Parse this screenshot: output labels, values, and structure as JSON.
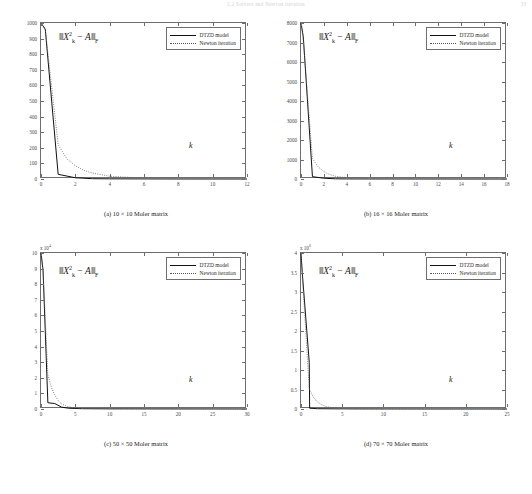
{
  "running_head": "2.2 Solvers and Newton iteration",
  "page_number": "33",
  "legend": {
    "dtzd_label": "DTZD model",
    "newton_label": "Newton iteration"
  },
  "norm_label": {
    "prefix": "‖",
    "x": "X",
    "sub_k": "k",
    "sup_2": "2",
    "minus": " − ",
    "a": "A",
    "suffix": "‖",
    "sub_f": "F",
    "plain": "‖X²ₖ − A‖F"
  },
  "k_axis_label": "k",
  "panels": [
    {
      "id": "a",
      "caption": "(a) 10 × 10 Moler matrix",
      "matrix_size": "10 × 10",
      "exponent_text": "",
      "y_ticks": [
        "0",
        "100",
        "200",
        "300",
        "400",
        "500",
        "600",
        "700",
        "800",
        "900",
        "1000"
      ],
      "x_ticks": [
        "0",
        "2",
        "4",
        "6",
        "8",
        "10",
        "12"
      ]
    },
    {
      "id": "b",
      "caption": "(b) 16 × 16 Moler matrix",
      "matrix_size": "16 × 16",
      "exponent_text": "",
      "y_ticks": [
        "0",
        "1000",
        "2000",
        "3000",
        "4000",
        "5000",
        "6000",
        "7000",
        "8000"
      ],
      "x_ticks": [
        "0",
        "2",
        "4",
        "6",
        "8",
        "10",
        "12",
        "14",
        "16",
        "18"
      ]
    },
    {
      "id": "c",
      "caption": "(c) 50 × 50 Moler matrix",
      "matrix_size": "50 × 50",
      "exponent_text": "x 10",
      "exponent_power": "4",
      "y_ticks": [
        "0",
        "1",
        "2",
        "3",
        "4",
        "5",
        "6",
        "7",
        "8",
        "9",
        "10"
      ],
      "x_ticks": [
        "0",
        "5",
        "10",
        "15",
        "20",
        "25",
        "30"
      ]
    },
    {
      "id": "d",
      "caption": "(d) 70 × 70 Moler matrix",
      "matrix_size": "70 × 70",
      "exponent_text": "x 10",
      "exponent_power": "6",
      "y_ticks": [
        "0",
        "0.5",
        "1",
        "1.5",
        "2",
        "2.5",
        "3",
        "3.5",
        "4"
      ],
      "x_ticks": [
        "0",
        "5",
        "10",
        "15",
        "20",
        "25"
      ]
    }
  ],
  "chart_data": [
    {
      "type": "line",
      "title": "(a) 10 × 10 Moler matrix",
      "xlabel": "k",
      "ylabel": "‖X_k^2 − A‖_F",
      "xlim": [
        0,
        12
      ],
      "ylim": [
        0,
        1000
      ],
      "y_scale_factor": 1,
      "grid": false,
      "legend_position": "top-right",
      "series": [
        {
          "name": "DTZD model",
          "style": "solid",
          "x": [
            0,
            0.25,
            1,
            2,
            3,
            4,
            6,
            8,
            10,
            12
          ],
          "y": [
            1000,
            960,
            30,
            8,
            2,
            1,
            0.5,
            0.2,
            0.1,
            0.05
          ]
        },
        {
          "name": "Newton iteration",
          "style": "dotted",
          "x": [
            0,
            0.25,
            1,
            1.5,
            2,
            2.5,
            3,
            4,
            6,
            8,
            10,
            12
          ],
          "y": [
            1000,
            955,
            220,
            130,
            85,
            55,
            38,
            18,
            5,
            2,
            1,
            0.5
          ]
        }
      ]
    },
    {
      "type": "line",
      "title": "(b) 16 × 16 Moler matrix",
      "xlabel": "k",
      "ylabel": "‖X_k^2 − A‖_F",
      "xlim": [
        0,
        18
      ],
      "ylim": [
        0,
        8000
      ],
      "y_scale_factor": 1,
      "grid": false,
      "legend_position": "top-right",
      "series": [
        {
          "name": "DTZD model",
          "style": "solid",
          "x": [
            0,
            0.2,
            1,
            2,
            3,
            4,
            6,
            10,
            14,
            18
          ],
          "y": [
            8000,
            7300,
            120,
            40,
            10,
            4,
            2,
            1,
            0.5,
            0.2
          ]
        },
        {
          "name": "Newton iteration",
          "style": "dotted",
          "x": [
            0,
            0.2,
            1,
            1.5,
            2,
            2.5,
            3,
            4,
            5,
            6,
            10,
            14,
            18
          ],
          "y": [
            8000,
            7100,
            1050,
            620,
            380,
            230,
            140,
            70,
            35,
            18,
            5,
            2,
            1
          ]
        }
      ]
    },
    {
      "type": "line",
      "title": "(c) 50 × 50 Moler matrix",
      "xlabel": "k",
      "ylabel": "‖X_k^2 − A‖_F",
      "xlim": [
        0,
        30
      ],
      "ylim": [
        0,
        100000
      ],
      "y_scale_factor": 10000,
      "grid": false,
      "legend_position": "top-right",
      "series": [
        {
          "name": "DTZD model",
          "style": "solid",
          "x": [
            0,
            0.3,
            1,
            2,
            3,
            4,
            6,
            10,
            20,
            30
          ],
          "y": [
            100000,
            89000,
            4000,
            3500,
            1200,
            500,
            200,
            100,
            50,
            20
          ]
        },
        {
          "name": "Newton iteration",
          "style": "dotted",
          "x": [
            0,
            0.3,
            1,
            1.5,
            2,
            2.5,
            3,
            4,
            5,
            6,
            10,
            20,
            30
          ],
          "y": [
            100000,
            88000,
            22000,
            14000,
            9000,
            5500,
            3200,
            1400,
            700,
            350,
            120,
            40,
            15
          ]
        }
      ]
    },
    {
      "type": "line",
      "title": "(d) 70 × 70 Moler matrix",
      "xlabel": "k",
      "ylabel": "‖X_k^2 − A‖_F",
      "xlim": [
        0,
        25
      ],
      "ylim": [
        0,
        4000000
      ],
      "y_scale_factor": 1000000,
      "grid": false,
      "legend_position": "top-right",
      "series": [
        {
          "name": "DTZD model",
          "style": "solid",
          "x": [
            0,
            0.15,
            1,
            1.05,
            2,
            4,
            8,
            15,
            25
          ],
          "y": [
            4000000,
            3500000,
            1200000,
            20000,
            8000,
            4000,
            2000,
            1000,
            500
          ]
        },
        {
          "name": "Newton iteration",
          "style": "dotted",
          "x": [
            0,
            0.15,
            1,
            1.5,
            2,
            2.5,
            3,
            4,
            5,
            6,
            8,
            15,
            25
          ],
          "y": [
            4000000,
            3450000,
            520000,
            300000,
            180000,
            110000,
            65000,
            28000,
            14000,
            8000,
            4000,
            1500,
            600
          ]
        }
      ]
    }
  ]
}
